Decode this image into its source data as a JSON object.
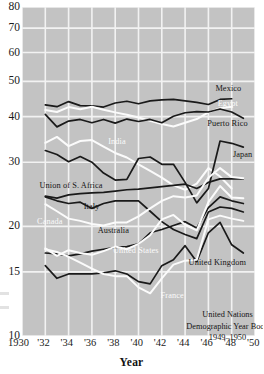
{
  "chart_data": {
    "type": "line",
    "title": "",
    "xlabel": "Year",
    "ylabel": "",
    "yscale": "log",
    "ylim": [
      10,
      80
    ],
    "xlim": [
      1930,
      1950
    ],
    "grid": true,
    "legend_position": "inline-annotations",
    "y_ticks": [
      80,
      70,
      60,
      50,
      40,
      30,
      20,
      15,
      10
    ],
    "y_tick_labels": [
      "80",
      "70",
      "60",
      "50",
      "40",
      "30",
      "20",
      "15",
      "10"
    ],
    "x_ticks": [
      1930,
      1932,
      1934,
      1936,
      1938,
      1940,
      1942,
      1944,
      1946,
      1948,
      1950
    ],
    "x_tick_labels": [
      "1930",
      "'32",
      "'34",
      "'36",
      "'38",
      "'40",
      "'42",
      "'44",
      "'46",
      "'48",
      "'50"
    ],
    "x": [
      1932,
      1933,
      1934,
      1935,
      1936,
      1937,
      1938,
      1939,
      1940,
      1941,
      1942,
      1943,
      1944,
      1945,
      1946,
      1947,
      1948,
      1949
    ],
    "series": [
      {
        "name": "Mexico",
        "color": "#1a1a1a",
        "label_x": 1946.6,
        "label_y": 47.6,
        "values": [
          43.1,
          42.6,
          44.0,
          42.9,
          42.8,
          42.5,
          43.6,
          44.1,
          43.4,
          44.2,
          44.5,
          44.6,
          44.2,
          43.8,
          43.2,
          44.6,
          44.8,
          null
        ]
      },
      {
        "name": "Egypt",
        "color": "#fbfbfb",
        "label_x": 1946.8,
        "label_y": 43.3,
        "values": [
          41.7,
          41.2,
          42.5,
          41.9,
          42.6,
          41.8,
          41.1,
          40.5,
          39.8,
          39.0,
          38.2,
          37.6,
          38.5,
          39.4,
          41.1,
          42.2,
          42.6,
          null
        ]
      },
      {
        "name": "Puerto Rico",
        "color": "#1a1a1a",
        "label_x": 1945.9,
        "label_y": 38.3,
        "values": [
          40.6,
          37.5,
          38.9,
          39.3,
          38.5,
          39.3,
          38.4,
          39.4,
          38.8,
          39.3,
          38.5,
          40.1,
          41.0,
          41.3,
          41.2,
          42.0,
          41.2,
          39.6
        ]
      },
      {
        "name": "India",
        "color": "#fbfbfb",
        "label_x": 1937.4,
        "label_y": 34.2,
        "values": [
          33.9,
          35.2,
          33.2,
          34.3,
          34.5,
          33.1,
          31.8,
          30.9,
          29.6,
          28.4,
          27.2,
          25.9,
          25.2,
          26.2,
          28.9,
          27.4,
          25.4,
          null
        ]
      },
      {
        "name": "Japan",
        "color": "#1a1a1a",
        "label_x": 1948.1,
        "label_y": 31.4,
        "values": [
          32.3,
          31.5,
          30.1,
          31.1,
          30.0,
          28.0,
          26.8,
          26.9,
          30.7,
          31.0,
          29.6,
          29.6,
          26.4,
          23.2,
          25.4,
          34.3,
          33.8,
          33.0
        ]
      },
      {
        "name": "Union of S. Africa",
        "color": "#1a1a1a",
        "label_x": 1931.5,
        "label_y": 25.8,
        "values": [
          24.2,
          23.9,
          24.4,
          24.6,
          24.7,
          24.8,
          25.0,
          25.2,
          25.3,
          25.5,
          25.7,
          25.9,
          26.1,
          25.4,
          26.4,
          27.0,
          27.0,
          27.0
        ]
      },
      {
        "name": "Italy",
        "color": "#1a1a1a",
        "label_x": 1935.3,
        "label_y": 22.6,
        "values": [
          24.1,
          23.5,
          23.1,
          23.3,
          22.4,
          23.1,
          23.5,
          23.5,
          23.5,
          22.0,
          20.6,
          19.6,
          19.0,
          18.5,
          21.9,
          22.6,
          22.4,
          21.9
        ]
      },
      {
        "name": "Canada",
        "color": "#fbfbfb",
        "label_x": 1931.3,
        "label_y": 20.5,
        "values": [
          23.0,
          22.0,
          21.0,
          20.7,
          20.3,
          20.1,
          20.5,
          20.5,
          21.3,
          22.4,
          23.5,
          24.2,
          24.0,
          24.3,
          27.2,
          28.9,
          27.3,
          27.1
        ]
      },
      {
        "name": "Australia",
        "color": "#1a1a1a",
        "label_x": 1936.5,
        "label_y": 19.4,
        "values": [
          16.9,
          16.8,
          16.6,
          16.8,
          17.1,
          17.3,
          17.5,
          17.6,
          17.9,
          19.2,
          19.6,
          20.1,
          20.6,
          19.8,
          22.5,
          24.1,
          23.5,
          23.1
        ]
      },
      {
        "name": "United States",
        "color": "#fbfbfb",
        "label_x": 1937.8,
        "label_y": 17.1,
        "values": [
          17.4,
          16.6,
          17.2,
          16.9,
          16.7,
          17.1,
          17.6,
          17.3,
          17.9,
          18.9,
          20.9,
          21.5,
          20.2,
          19.5,
          23.3,
          25.8,
          24.0,
          23.9
        ]
      },
      {
        "name": "United Kingdom",
        "color": "#1a1a1a",
        "label_x": 1944.3,
        "label_y": 15.9,
        "values": [
          15.6,
          14.4,
          14.8,
          14.8,
          14.8,
          14.9,
          15.1,
          14.8,
          14.1,
          13.9,
          15.6,
          16.2,
          17.7,
          16.0,
          19.2,
          20.5,
          17.8,
          16.9
        ]
      },
      {
        "name": "France",
        "color": "#fbfbfb",
        "label_x": 1941.9,
        "label_y": 12.9,
        "values": [
          17.3,
          17.0,
          16.5,
          15.9,
          15.3,
          14.8,
          14.6,
          14.6,
          13.6,
          13.1,
          14.4,
          15.7,
          16.1,
          16.2,
          20.9,
          21.4,
          21.0,
          20.7
        ]
      }
    ],
    "annotations": [
      {
        "name": "source-line-1",
        "text": "United Nations"
      },
      {
        "name": "source-line-2",
        "text": "Demographic Year Book"
      },
      {
        "name": "source-line-3",
        "text": "1949–1950"
      }
    ],
    "colors": {
      "plot_background": "#c3c3c3",
      "gridline": "#f2f2f2",
      "dark_series": "#1a1a1a",
      "light_series": "#fbfbfb",
      "text": "#1b1b1b",
      "page_background": "#ffffff"
    }
  }
}
